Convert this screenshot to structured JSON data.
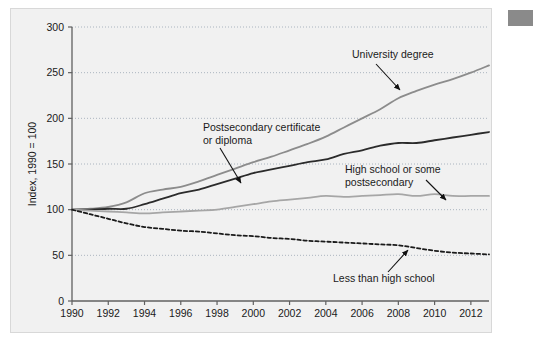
{
  "figure": {
    "panel_bg": "#f1f1f1",
    "panel_border": "#d8d8d8",
    "corner_block_color": "#8a8a8a"
  },
  "chart_data": {
    "type": "line",
    "title": "",
    "subtitle": "",
    "xlabel": "",
    "ylabel": "Index, 1990 = 100",
    "xlim": [
      1990,
      2013
    ],
    "ylim": [
      0,
      300
    ],
    "grid": true,
    "grid_axis": "y",
    "legend_position": "inline-annotations",
    "yticks": [
      0,
      50,
      100,
      150,
      200,
      250,
      300
    ],
    "ytick_labels": [
      "0",
      "50",
      "100",
      "150",
      "200",
      "250",
      "300"
    ],
    "xticks": [
      1990,
      1992,
      1994,
      1996,
      1998,
      2000,
      2002,
      2004,
      2006,
      2008,
      2010,
      2012
    ],
    "xtick_labels": [
      "1990",
      "1992",
      "1994",
      "1996",
      "1998",
      "2000",
      "2002",
      "2004",
      "2006",
      "2008",
      "2010",
      "2012"
    ],
    "x": [
      1990,
      1991,
      1992,
      1993,
      1994,
      1995,
      1996,
      1997,
      1998,
      1999,
      2000,
      2001,
      2002,
      2003,
      2004,
      2005,
      2006,
      2007,
      2008,
      2009,
      2010,
      2011,
      2012,
      2013
    ],
    "series": [
      {
        "name": "University degree",
        "color": "#8c8c8c",
        "style": "solid",
        "width": 1.8,
        "values": [
          100,
          101,
          103,
          108,
          118,
          122,
          125,
          131,
          138,
          145,
          152,
          158,
          165,
          172,
          180,
          190,
          200,
          210,
          222,
          230,
          237,
          243,
          250,
          258
        ]
      },
      {
        "name": "Postsecondary certificate or diploma",
        "color": "#2b2b2b",
        "style": "solid",
        "width": 1.8,
        "values": [
          100,
          100,
          101,
          101,
          106,
          112,
          118,
          122,
          128,
          134,
          140,
          144,
          148,
          152,
          155,
          161,
          165,
          170,
          173,
          173,
          176,
          179,
          182,
          185
        ]
      },
      {
        "name": "High school or some postsecondary",
        "color": "#a6a6a6",
        "style": "solid",
        "width": 1.8,
        "values": [
          100,
          99,
          98,
          97,
          96,
          97,
          98,
          99,
          100,
          103,
          106,
          109,
          111,
          113,
          115,
          114,
          115,
          116,
          117,
          115,
          117,
          115,
          115,
          115
        ]
      },
      {
        "name": "Less than high school",
        "color": "#1a1a1a",
        "style": "dashed",
        "width": 1.8,
        "values": [
          100,
          95,
          90,
          85,
          81,
          79,
          77,
          76,
          74,
          72,
          71,
          69,
          68,
          66,
          65,
          64,
          63,
          62,
          61,
          58,
          55,
          53,
          52,
          51
        ]
      }
    ],
    "annotations": [
      {
        "id": "university-degree",
        "lines": [
          "University degree"
        ],
        "text": "University degree",
        "text_x": 352,
        "text_y": 58,
        "arrow_from_x": 376,
        "arrow_from_y": 64,
        "arrow_to_x": 400,
        "arrow_to_y": 90
      },
      {
        "id": "postsecondary-certificate",
        "lines": [
          "Postsecondary certificate",
          "or diploma"
        ],
        "text": "Postsecondary certificate or diploma",
        "text_x": 203,
        "text_y": 131,
        "arrow_from_x": 220,
        "arrow_from_y": 148,
        "arrow_to_x": 241,
        "arrow_to_y": 183
      },
      {
        "id": "high-school-or-some-postsecondary",
        "lines": [
          "High school or some",
          "postsecondary"
        ],
        "text": "High school or some postsecondary",
        "text_x": 345,
        "text_y": 173,
        "arrow_from_x": 426,
        "arrow_from_y": 180,
        "arrow_to_x": 446,
        "arrow_to_y": 200
      },
      {
        "id": "less-than-high-school",
        "lines": [
          "Less than high school"
        ],
        "text": "Less than high school",
        "text_x": 333,
        "text_y": 282,
        "arrow_from_x": 388,
        "arrow_from_y": 272,
        "arrow_to_x": 408,
        "arrow_to_y": 250
      }
    ]
  }
}
